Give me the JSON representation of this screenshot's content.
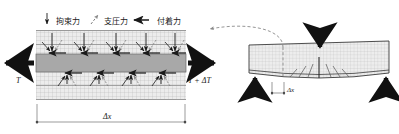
{
  "figure": {
    "legend": [
      {
        "id": "restraint",
        "label": "拘束力",
        "icon": "down-arrow-icon"
      },
      {
        "id": "bearing",
        "label": "支圧力",
        "icon": "diagonal-dashed-arrow-icon"
      },
      {
        "id": "bond",
        "label": "付着力",
        "icon": "left-arrow-icon"
      }
    ],
    "left_panel": {
      "name": "rebar-segment-free-body",
      "tension_left": "T",
      "tension_right": "T + ΔT",
      "dimension": "Δx",
      "cluster_count_top": 5,
      "cluster_count_bottom": 4
    },
    "right_panel": {
      "name": "deflected-beam",
      "dimension": "Δx",
      "load_arrow": "down-arrow-icon",
      "support_arrows": [
        "up-arrow-icon",
        "up-arrow-icon"
      ],
      "callout": "curved-dashed-leader-icon"
    },
    "colors": {
      "ink": "#1a1a1a",
      "rebar_fill": "#a8a8a8",
      "concrete_fill": "#ececec",
      "hatch": "#b4b4b4",
      "dashed": "#8a8a8a",
      "background": "#ffffff"
    }
  }
}
